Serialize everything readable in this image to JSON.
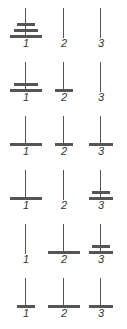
{
  "peg_labels": [
    "1",
    "2",
    "3"
  ],
  "disk_widths": {
    "S": 18,
    "M": 24,
    "L": 32
  },
  "colors": {
    "disk": "#555555",
    "pole": "#555555",
    "label": "#333333"
  },
  "states": [
    {
      "pegs": [
        [
          "L",
          "M",
          "S"
        ],
        [],
        []
      ]
    },
    {
      "pegs": [
        [
          "L",
          "M"
        ],
        [
          "S"
        ],
        []
      ]
    },
    {
      "pegs": [
        [
          "L"
        ],
        [
          "S"
        ],
        [
          "M"
        ]
      ]
    },
    {
      "pegs": [
        [
          "L"
        ],
        [],
        [
          "M",
          "S"
        ]
      ]
    },
    {
      "pegs": [
        [],
        [
          "L"
        ],
        [
          "M",
          "S"
        ]
      ]
    },
    {
      "pegs": [
        [
          "S"
        ],
        [
          "L"
        ],
        [
          "M"
        ]
      ]
    }
  ]
}
